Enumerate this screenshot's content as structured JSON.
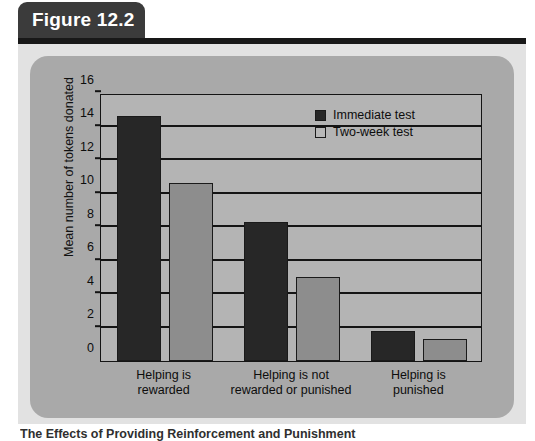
{
  "figure": {
    "tab_label": "Figure 12.2",
    "caption": "The Effects of Providing Reinforcement and Punishment"
  },
  "chart_data": {
    "type": "bar",
    "title": "",
    "xlabel": "",
    "ylabel": "Mean number of tokens donated",
    "ylim": [
      0,
      16
    ],
    "ytick_values": [
      0,
      2,
      4,
      6,
      8,
      10,
      12,
      14,
      16
    ],
    "ytick_labels": [
      "0",
      "2",
      "4",
      "6",
      "8",
      "10",
      "12",
      "14",
      "16"
    ],
    "grid": true,
    "legend_position": "top-right",
    "categories": [
      "Helping is rewarded",
      "Helping is not rewarded or punished",
      "Helping is punished"
    ],
    "category_lines": [
      [
        "Helping is",
        "rewarded"
      ],
      [
        "Helping is not",
        "rewarded or punished"
      ],
      [
        "Helping is",
        "punished"
      ]
    ],
    "series": [
      {
        "name": "Immediate test",
        "color": "#272727",
        "values": [
          14.6,
          8.3,
          1.8
        ]
      },
      {
        "name": "Two-week test",
        "color": "#8d8d8d",
        "values": [
          10.6,
          5.0,
          1.3
        ]
      }
    ]
  }
}
